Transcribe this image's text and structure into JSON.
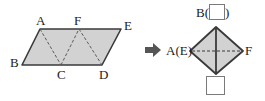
{
  "figure": {
    "colors": {
      "fill": "#d2d2d2",
      "stroke": "#3a3a3a",
      "dash": "#5a5a5a",
      "text": "#1b1b1b",
      "tofu_border": "#7a7a7a",
      "background": "#ffffff"
    },
    "left_shape": {
      "name": "parallelogram",
      "vertices": [
        {
          "label": "A",
          "x": 40,
          "y": 29
        },
        {
          "label": "F",
          "x": 79,
          "y": 29
        },
        {
          "label": "E",
          "x": 121,
          "y": 29
        },
        {
          "label": "D",
          "x": 102,
          "y": 65
        },
        {
          "label": "C",
          "x": 61,
          "y": 65
        },
        {
          "label": "B",
          "x": 22,
          "y": 65
        }
      ],
      "dashed_segments": [
        {
          "from": "A",
          "to": "C"
        },
        {
          "from": "C",
          "to": "F"
        },
        {
          "from": "F",
          "to": "D"
        }
      ],
      "labels": [
        "A",
        "F",
        "E",
        "B",
        "C",
        "D"
      ]
    },
    "arrow": {
      "name": "transform-arrow",
      "direction": "right",
      "x": 146,
      "y": 43
    },
    "right_shape": {
      "name": "rhombus",
      "vertices": [
        {
          "label": "top",
          "x": 216,
          "y": 27
        },
        {
          "label": "right",
          "x": 243,
          "y": 51
        },
        {
          "label": "bottom",
          "x": 216,
          "y": 74
        },
        {
          "label": "left",
          "x": 190,
          "y": 51
        }
      ],
      "solid_diagonal": {
        "from": "top",
        "to": "bottom"
      },
      "dashed_diagonal": {
        "from": "left",
        "to": "right"
      },
      "labels": {
        "top": "B(",
        "top_suffix": ")",
        "left": "A(E)",
        "right": "F"
      }
    },
    "glyphs": {
      "missing_char_top": "□",
      "missing_char_bottom": "□"
    }
  }
}
